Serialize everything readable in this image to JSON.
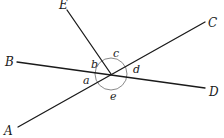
{
  "diagram": {
    "points": {
      "A": "A",
      "B": "B",
      "C": "C",
      "D": "D",
      "E": "E"
    },
    "angles": {
      "a": "a",
      "b": "b",
      "c": "c",
      "d": "d",
      "e": "e"
    },
    "colors": {
      "line": "#1a1a1a",
      "arc": "#8a8a8a"
    }
  }
}
